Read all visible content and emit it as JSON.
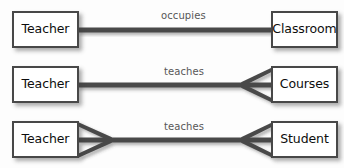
{
  "diagram": {
    "type": "entity-relationship-diagram",
    "notation": "crows-foot",
    "canvas": {
      "width": 344,
      "height": 168,
      "background": "#fdfdfd"
    },
    "style": {
      "box_fill": "#ffffff",
      "box_border": "#484848",
      "connector_color": "#4a4a4a",
      "label_color": "#575757",
      "entity_text_color": "#0d0d0d"
    },
    "rows": [
      {
        "id": "row-occupies",
        "left_entity": "Teacher",
        "right_entity": "Classroom",
        "relationship": "occupies",
        "left_cardinality": "one",
        "right_cardinality": "one"
      },
      {
        "id": "row-teaches-courses",
        "left_entity": "Teacher",
        "right_entity": "Courses",
        "relationship": "teaches",
        "left_cardinality": "one",
        "right_cardinality": "many"
      },
      {
        "id": "row-teaches-student",
        "left_entity": "Teacher",
        "right_entity": "Student",
        "relationship": "teaches",
        "left_cardinality": "many",
        "right_cardinality": "many"
      }
    ]
  }
}
